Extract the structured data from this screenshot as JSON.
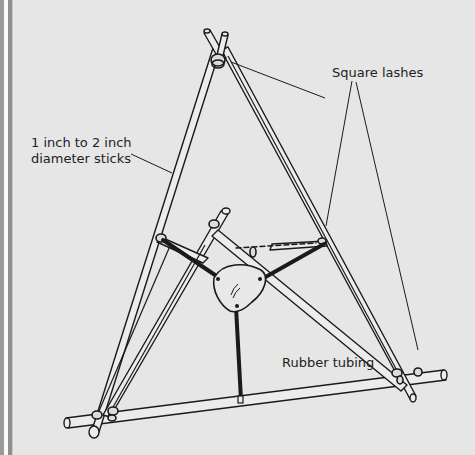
{
  "diagram": {
    "labels": {
      "sticks": [
        "1 inch to 2 inch",
        "diameter sticks"
      ],
      "lashes": "Square lashes",
      "tubing": "Rubber tubing"
    },
    "components": [
      "three long sticks lashed at apex",
      "bottom cross stick",
      "middle cross stick",
      "three square lashes",
      "rubber tubing bands",
      "pouch"
    ],
    "colors": {
      "background": "#e6e6e6",
      "ink": "#1a1a1a",
      "stick_fill": "#ececec"
    }
  }
}
